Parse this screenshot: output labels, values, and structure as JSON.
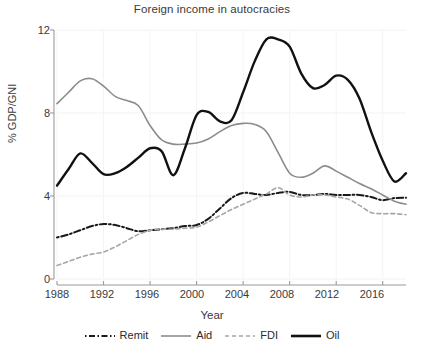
{
  "chart_data": {
    "type": "line",
    "title": "Foreign income in autocracies",
    "xlabel": "Year",
    "ylabel": "% GDP/GNI",
    "xlim": [
      1988,
      2018
    ],
    "ylim": [
      0,
      12
    ],
    "yticks": [
      0,
      4,
      8,
      12
    ],
    "xticks": [
      1988,
      1992,
      1996,
      2000,
      2004,
      2008,
      2012,
      2016
    ],
    "grid": "faint vertical gridlines at x ticks, faint horizontal at y ticks",
    "legend_position": "below plot, horizontal",
    "x": [
      1988,
      1989,
      1990,
      1991,
      1992,
      1993,
      1994,
      1995,
      1996,
      1997,
      1998,
      1999,
      2000,
      2001,
      2002,
      2003,
      2004,
      2005,
      2006,
      2007,
      2008,
      2009,
      2010,
      2011,
      2012,
      2013,
      2014,
      2015,
      2016,
      2017,
      2018
    ],
    "series": [
      {
        "name": "Remit",
        "color": "#1a1a1a",
        "style": "dash-dot",
        "width": 2.0,
        "values": [
          2.0,
          2.15,
          2.35,
          2.55,
          2.65,
          2.6,
          2.45,
          2.3,
          2.35,
          2.4,
          2.45,
          2.55,
          2.6,
          2.9,
          3.4,
          3.9,
          4.15,
          4.1,
          4.05,
          4.15,
          4.2,
          4.05,
          4.05,
          4.1,
          4.05,
          4.05,
          4.05,
          3.95,
          3.8,
          3.9,
          3.92
        ]
      },
      {
        "name": "Aid",
        "color": "#8c8c8c",
        "style": "solid",
        "width": 1.6,
        "values": [
          8.45,
          9.0,
          9.55,
          9.65,
          9.3,
          8.8,
          8.6,
          8.35,
          7.4,
          6.7,
          6.5,
          6.5,
          6.55,
          6.75,
          7.1,
          7.4,
          7.5,
          7.45,
          7.1,
          6.1,
          5.1,
          4.9,
          5.1,
          5.45,
          5.2,
          4.9,
          4.6,
          4.35,
          4.05,
          3.75,
          3.6
        ]
      },
      {
        "name": "FDI",
        "color": "#a6a6a6",
        "style": "dashed",
        "width": 1.6,
        "values": [
          0.65,
          0.85,
          1.05,
          1.2,
          1.3,
          1.55,
          1.85,
          2.15,
          2.35,
          2.4,
          2.4,
          2.45,
          2.5,
          2.75,
          3.05,
          3.35,
          3.6,
          3.85,
          4.1,
          4.4,
          4.05,
          3.95,
          4.05,
          4.05,
          3.95,
          3.85,
          3.55,
          3.2,
          3.15,
          3.15,
          3.1
        ]
      },
      {
        "name": "Oil",
        "color": "#111111",
        "style": "solid",
        "width": 2.4,
        "values": [
          4.5,
          5.3,
          6.05,
          5.6,
          5.05,
          5.1,
          5.4,
          5.85,
          6.3,
          6.15,
          5.0,
          6.3,
          7.9,
          8.05,
          7.6,
          7.65,
          9.0,
          10.5,
          11.55,
          11.55,
          11.2,
          9.9,
          9.2,
          9.35,
          9.8,
          9.6,
          8.7,
          7.1,
          5.7,
          4.7,
          5.1
        ]
      }
    ]
  },
  "legend": {
    "items": [
      {
        "label": "Remit",
        "icon": "dash-dot-line-swatch"
      },
      {
        "label": "Aid",
        "icon": "solid-line-swatch"
      },
      {
        "label": "FDI",
        "icon": "dashed-line-swatch"
      },
      {
        "label": "Oil",
        "icon": "thick-solid-line-swatch"
      }
    ]
  },
  "axes": {
    "y_tick_labels": [
      "12",
      "8",
      "4",
      "0"
    ],
    "x_tick_labels": [
      "1988",
      "1992",
      "1996",
      "2000",
      "2004",
      "2008",
      "2012",
      "2016"
    ]
  }
}
